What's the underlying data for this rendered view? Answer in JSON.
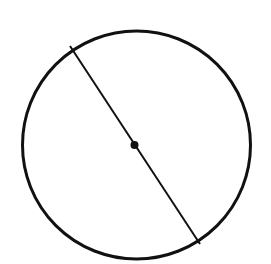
{
  "diagram": {
    "type": "geometry",
    "background": "#ffffff",
    "stroke_color": "#111111",
    "circle": {
      "cx": 136.5,
      "cy": 145,
      "r": 114,
      "stroke_width": 3
    },
    "diameter": {
      "x1": 70,
      "y1": 46,
      "x2": 200,
      "y2": 244,
      "stroke_width": 2
    },
    "center_point": {
      "cx": 134.5,
      "cy": 145,
      "r": 4
    }
  }
}
